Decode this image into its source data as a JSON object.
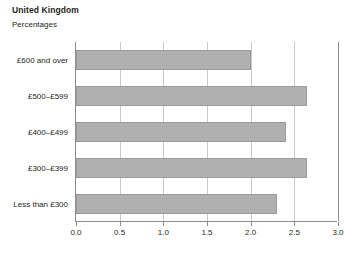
{
  "chart_data": {
    "type": "bar",
    "orientation": "horizontal",
    "title": "United Kingdom",
    "subtitle": "Percentages",
    "xlabel": "",
    "ylabel": "",
    "categories": [
      "£600 and over",
      "£500–£599",
      "£400–£499",
      "£300–£399",
      "Less than £300"
    ],
    "values": [
      2.0,
      2.65,
      2.4,
      2.65,
      2.3
    ],
    "xlim": [
      0.0,
      3.0
    ],
    "xticks": [
      0.0,
      0.5,
      1.0,
      1.5,
      2.0,
      2.5,
      3.0
    ],
    "xtick_labels": [
      "0.0",
      "0.5",
      "1.0",
      "1.5",
      "2.0",
      "2.5",
      "3.0"
    ],
    "grid": "vertical",
    "legend": null,
    "bar_color": "#b0b0b0",
    "grid_color": "#c9c9c9",
    "axis_color": "#8c8c8c",
    "text_color": "#231f20"
  }
}
